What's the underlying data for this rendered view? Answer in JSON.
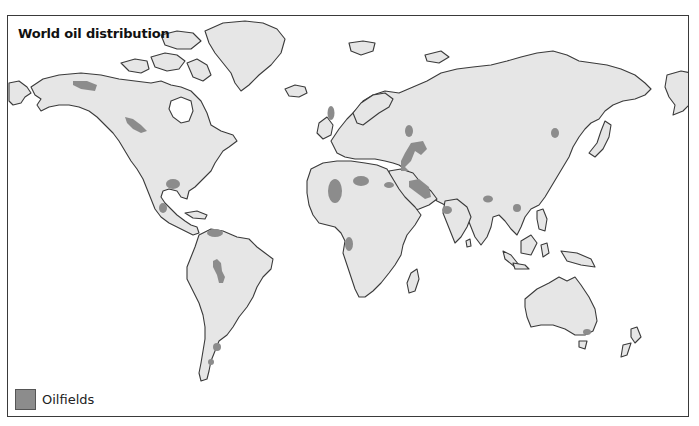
{
  "map": {
    "title": "World oil distribution",
    "land_color": "#e6e6e6",
    "outline_color": "#3a3a3a",
    "oilfield_color": "#8c8c8c",
    "legend": {
      "items": [
        {
          "label": "Oilfields",
          "color": "#8c8c8c"
        }
      ]
    },
    "regions": [
      "North America",
      "Greenland",
      "South America",
      "Europe",
      "Africa",
      "Asia",
      "Arabian Peninsula",
      "Indian Subcontinent",
      "Southeast Asia",
      "Australia",
      "New Zealand",
      "Madagascar",
      "Japan",
      "United Kingdom"
    ],
    "oilfield_locations": [
      "Northern Alaska",
      "Western Canada (Alberta)",
      "US Gulf Coast",
      "Mexico (Gulf)",
      "Venezuela",
      "Western Amazon / Peru-Bolivia",
      "Southern Argentina",
      "Tierra del Fuego",
      "North Sea",
      "Volga-Urals",
      "Caspian Sea",
      "Persian Gulf",
      "Libya / North Africa",
      "Algeria / Sahara",
      "Nigeria (Niger Delta)",
      "Egypt (Suez)",
      "Western Siberia",
      "North-east China",
      "Burma / Bengal",
      "Indonesia / South China Sea",
      "Bombay High (India)",
      "South-east Australia (Bass Strait)"
    ]
  }
}
